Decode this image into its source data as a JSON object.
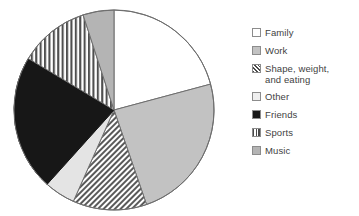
{
  "chart_data": {
    "type": "pie",
    "title": "",
    "subtitle": "",
    "xlabel": "",
    "ylabel": "",
    "legend_position": "right",
    "grid": false,
    "start_angle_deg": 0,
    "direction": "clockwise",
    "categories": [
      "Family",
      "Work",
      "Shape, weight,\nand eating",
      "Other",
      "Friends",
      "Sports",
      "Music"
    ],
    "values": [
      21,
      24,
      12,
      5,
      22,
      11,
      5
    ],
    "units": "percent",
    "slices": [
      {
        "label": "Family",
        "value": 21,
        "start_deg": 0,
        "end_deg": 75,
        "fill": "#ffffff",
        "pattern": "solid",
        "stroke": "#6e6e6e"
      },
      {
        "label": "Work",
        "value": 24,
        "start_deg": 75,
        "end_deg": 161,
        "fill": "#c2c2c2",
        "pattern": "solid",
        "stroke": "#6e6e6e"
      },
      {
        "label": "Shape, weight, and eating",
        "value": 12,
        "start_deg": 161,
        "end_deg": 204,
        "fill": "#c9c9c9",
        "pattern": "diagonal-hatch",
        "stroke": "#6e6e6e"
      },
      {
        "label": "Other",
        "value": 5,
        "start_deg": 204,
        "end_deg": 222,
        "fill": "#e4e4e4",
        "pattern": "solid",
        "stroke": "#6e6e6e"
      },
      {
        "label": "Friends",
        "value": 22,
        "start_deg": 222,
        "end_deg": 301,
        "fill": "#171717",
        "pattern": "solid",
        "stroke": "#171717"
      },
      {
        "label": "Sports",
        "value": 11,
        "start_deg": 301,
        "end_deg": 342,
        "fill": "#ffffff",
        "pattern": "vertical-stripe",
        "stroke": "#6e6e6e"
      },
      {
        "label": "Music",
        "value": 5,
        "start_deg": 342,
        "end_deg": 360,
        "fill": "#b4b4b4",
        "pattern": "solid",
        "stroke": "#6e6e6e"
      }
    ]
  },
  "legend": {
    "items": [
      {
        "label": "Family",
        "swatch": "swatch-white",
        "pattern": "solid"
      },
      {
        "label": "Work",
        "swatch": "swatch-light-gray",
        "pattern": "solid"
      },
      {
        "label": "Shape, weight,\nand eating",
        "swatch": "swatch-diagonal-hatch",
        "pattern": "diagonal-hatch"
      },
      {
        "label": "Other",
        "swatch": "swatch-very-light-gray",
        "pattern": "solid"
      },
      {
        "label": "Friends",
        "swatch": "swatch-black",
        "pattern": "solid"
      },
      {
        "label": "Sports",
        "swatch": "swatch-vertical-stripe",
        "pattern": "vertical-stripe"
      },
      {
        "label": "Music",
        "swatch": "swatch-medium-gray",
        "pattern": "solid"
      }
    ]
  },
  "colors": {
    "white": "#ffffff",
    "very_light_gray": "#e4e4e4",
    "light_gray": "#c2c2c2",
    "medium_gray": "#b4b4b4",
    "hatch_gray": "#c9c9c9",
    "black": "#171717",
    "outline": "#6e6e6e",
    "text": "#3f3f3f"
  }
}
